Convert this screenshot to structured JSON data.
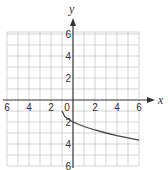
{
  "chart_data": {
    "type": "line",
    "title": "",
    "xlabel": "x",
    "ylabel": "y",
    "xlim": [
      -6,
      6
    ],
    "ylim": [
      -6,
      6
    ],
    "grid": true,
    "x_ticks": [
      -6,
      -4,
      -2,
      0,
      2,
      4,
      6
    ],
    "y_ticks": [
      -6,
      -4,
      -2,
      2,
      4,
      6
    ],
    "x_tick_labels": [
      "6",
      "4",
      "2",
      "0",
      "2",
      "4",
      "6"
    ],
    "y_tick_labels": [
      "6",
      "4",
      "2",
      "2",
      "4",
      "6"
    ],
    "series": [
      {
        "name": "curve",
        "x": [
          -1,
          -0.75,
          -0.5,
          0,
          1,
          2,
          3,
          4,
          5,
          6
        ],
        "y": [
          -1,
          -1.5,
          -1.71,
          -2,
          -2.41,
          -2.73,
          -3,
          -3.24,
          -3.45,
          -3.65
        ]
      }
    ]
  }
}
